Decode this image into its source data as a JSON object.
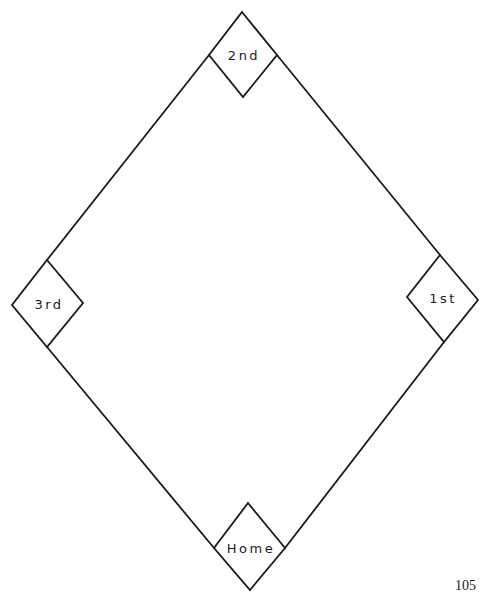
{
  "diagram": {
    "bases": [
      {
        "id": "second",
        "label": "2nd"
      },
      {
        "id": "third",
        "label": "3rd"
      },
      {
        "id": "first",
        "label": "1st"
      },
      {
        "id": "home",
        "label": "Home"
      }
    ]
  },
  "page": {
    "number": "105"
  }
}
